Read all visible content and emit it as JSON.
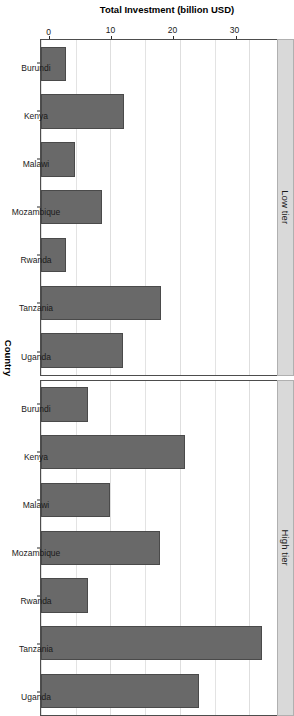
{
  "chart_data": {
    "type": "bar",
    "title": "",
    "subtitle": "",
    "orientation": "vertical-bars-rotated-canvas",
    "xlabel": "Country",
    "ylabel": "Total Investment (billion USD)",
    "categories": [
      "Burundi",
      "Kenya",
      "Malawi",
      "Mozambique",
      "Rwanda",
      "Tanzania",
      "Uganda"
    ],
    "ylim": [
      0,
      34
    ],
    "yticks": [
      0,
      10,
      20,
      30
    ],
    "ytick_labels": [
      "0",
      "10",
      "20",
      "30"
    ],
    "grid": true,
    "legend": "none",
    "facet_variable": "tier",
    "facets": [
      {
        "label": "Low tier",
        "categories": [
          "Burundi",
          "Kenya",
          "Malawi",
          "Mozambique",
          "Rwanda",
          "Tanzania",
          "Uganda"
        ],
        "values": [
          3.6,
          12.0,
          4.9,
          8.8,
          3.6,
          17.3,
          11.8
        ]
      },
      {
        "label": "High tier",
        "categories": [
          "Burundi",
          "Kenya",
          "Malawi",
          "Mozambique",
          "Rwanda",
          "Tanzania",
          "Uganda"
        ],
        "values": [
          6.8,
          20.7,
          9.9,
          17.2,
          6.8,
          31.9,
          22.8
        ]
      }
    ],
    "colors": {
      "bar_fill": "#696969",
      "bar_border": "#4a4a4a",
      "panel_background": "#ffffff",
      "panel_border": "#4d4d4d",
      "strip_background": "#d9d9d9",
      "strip_border": "#b0b0b0",
      "gridline": "#e3e3e3",
      "text": "#1a1a1a"
    }
  },
  "axis": {
    "y_title": "Total Investment (billion USD)",
    "x_title": "Country"
  }
}
